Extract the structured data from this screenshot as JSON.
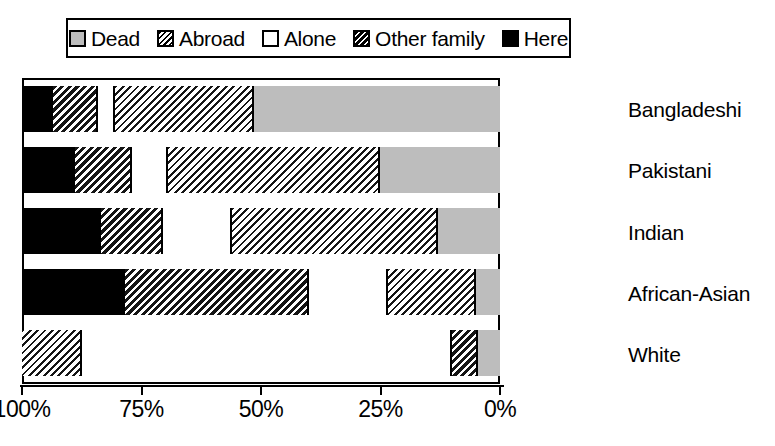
{
  "chart_data": {
    "type": "bar",
    "orientation": "horizontal",
    "stacked": true,
    "stack_total": 100,
    "title": "",
    "subtitle": "",
    "xlabel": "",
    "ylabel": "",
    "xlim": [
      100,
      0
    ],
    "x_axis_reversed": true,
    "grid": false,
    "legend_position": "top",
    "xticks": [
      "100%",
      "75%",
      "50%",
      "25%",
      "0%"
    ],
    "xtick_values": [
      100,
      75,
      50,
      25,
      0
    ],
    "categories": [
      "Bangladeshi",
      "Pakistani",
      "Indian",
      "African-Asian",
      "White"
    ],
    "legend": [
      {
        "label": "Dead",
        "pattern": "solid-light-gray",
        "swatch_class": "sw-dead",
        "seg_class": "p-dead",
        "color": "#bdbdbd"
      },
      {
        "label": "Abroad",
        "pattern": "diagonal-hatch-fine",
        "swatch_class": "sw-abroad",
        "seg_class": "p-abroad",
        "color": "#ffffff"
      },
      {
        "label": "Alone",
        "pattern": "solid-white",
        "swatch_class": "sw-alone",
        "seg_class": "p-alone",
        "color": "#ffffff"
      },
      {
        "label": "Other family",
        "pattern": "diagonal-hatch-bold",
        "swatch_class": "sw-other",
        "seg_class": "p-other",
        "color": "#ffffff"
      },
      {
        "label": "Here",
        "pattern": "solid-black",
        "swatch_class": "sw-here",
        "seg_class": "p-here",
        "color": "#000000"
      }
    ],
    "series": [
      {
        "name": "Here",
        "values": [
          6.5,
          11.0,
          16.5,
          21.5,
          0.0
        ]
      },
      {
        "name": "Other family",
        "values": [
          9.5,
          12.0,
          13.0,
          38.5,
          0.0
        ]
      },
      {
        "name": "Alone",
        "values": [
          3.5,
          7.5,
          14.5,
          16.5,
          77.5
        ]
      },
      {
        "name": "Abroad",
        "values": [
          29.0,
          44.5,
          43.0,
          18.5,
          5.0
        ]
      },
      {
        "name": "Dead",
        "values": [
          51.5,
          25.0,
          13.0,
          5.0,
          4.5
        ]
      }
    ],
    "stacks": [
      {
        "category": "Bangladeshi",
        "segments": [
          {
            "name": "Here",
            "value": 6.5,
            "seg_class": "p-here"
          },
          {
            "name": "Other family",
            "value": 9.5,
            "seg_class": "p-other"
          },
          {
            "name": "Alone",
            "value": 3.5,
            "seg_class": "p-alone"
          },
          {
            "name": "Abroad",
            "value": 29.0,
            "seg_class": "p-abroad"
          },
          {
            "name": "Dead",
            "value": 51.5,
            "seg_class": "p-dead"
          }
        ]
      },
      {
        "category": "Pakistani",
        "segments": [
          {
            "name": "Here",
            "value": 11.0,
            "seg_class": "p-here"
          },
          {
            "name": "Other family",
            "value": 12.0,
            "seg_class": "p-other"
          },
          {
            "name": "Alone",
            "value": 7.5,
            "seg_class": "p-alone"
          },
          {
            "name": "Abroad",
            "value": 44.5,
            "seg_class": "p-abroad"
          },
          {
            "name": "Dead",
            "value": 25.0,
            "seg_class": "p-dead"
          }
        ]
      },
      {
        "category": "Indian",
        "segments": [
          {
            "name": "Here",
            "value": 16.5,
            "seg_class": "p-here"
          },
          {
            "name": "Other family",
            "value": 13.0,
            "seg_class": "p-other"
          },
          {
            "name": "Alone",
            "value": 14.5,
            "seg_class": "p-alone"
          },
          {
            "name": "Abroad",
            "value": 43.0,
            "seg_class": "p-abroad"
          },
          {
            "name": "Dead",
            "value": 13.0,
            "seg_class": "p-dead"
          }
        ]
      },
      {
        "category": "African-Asian",
        "segments": [
          {
            "name": "Here",
            "value": 21.5,
            "seg_class": "p-here"
          },
          {
            "name": "Other family",
            "value": 38.5,
            "seg_class": "p-other"
          },
          {
            "name": "Alone",
            "value": 16.5,
            "seg_class": "p-alone"
          },
          {
            "name": "Abroad",
            "value": 18.5,
            "seg_class": "p-abroad"
          },
          {
            "name": "Dead",
            "value": 5.0,
            "seg_class": "p-dead"
          }
        ]
      },
      {
        "category": "White",
        "segments": [
          {
            "name": "Abroad",
            "value": 12.5,
            "seg_class": "p-abroad"
          },
          {
            "name": "Alone",
            "value": 77.5,
            "seg_class": "p-alone"
          },
          {
            "name": "Other family",
            "value": 5.5,
            "seg_class": "p-other"
          },
          {
            "name": "Dead",
            "value": 4.5,
            "seg_class": "p-dead"
          }
        ]
      }
    ]
  },
  "colors": {
    "foreground": "#000000",
    "background": "#ffffff",
    "dead_gray": "#bdbdbd"
  }
}
